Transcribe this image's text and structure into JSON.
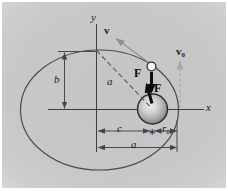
{
  "labels": {
    "y_axis": "y",
    "x_axis": "x",
    "velocity": "v",
    "velocity_initial": {
      "main": "v",
      "sub": "0"
    },
    "force_on_satellite": "F",
    "force_on_planet": "F",
    "distance_dashed": "a",
    "semi_minor_axis": "b",
    "focal_distance": "c",
    "initial_radius": {
      "main": "r",
      "sub": "0"
    },
    "semi_major_axis": "a",
    "focus_marker": "∗"
  },
  "colors": {
    "background_gray": "#c7c7c7",
    "line": "#444444",
    "dashed_line": "#555555",
    "force_arrow": "#0d0d0d",
    "velocity_arrow": "#8f8f8f",
    "v0_arrow": "#a9a9a9"
  }
}
